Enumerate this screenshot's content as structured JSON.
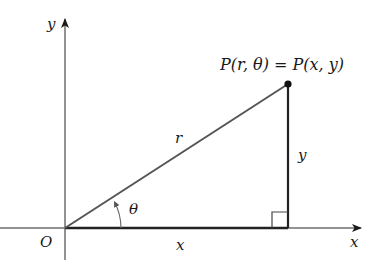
{
  "diagram": {
    "type": "polar-cartesian-relationship",
    "axes": {
      "x_label": "x",
      "y_label": "y",
      "origin_label": "O"
    },
    "point_label": "P(r, θ) = P(x, y)",
    "segments": {
      "hypotenuse_label": "r",
      "vertical_label": "y",
      "horizontal_label": "x"
    },
    "angle_label": "θ",
    "colors": {
      "axis": "#6e6e6e",
      "line": "#3a3a3a",
      "text": "#1a1a1a"
    }
  }
}
